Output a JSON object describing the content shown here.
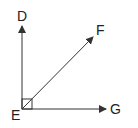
{
  "diagram": {
    "type": "geometry-angles",
    "vertex": {
      "label": "E",
      "x": 22,
      "y": 109
    },
    "rays": [
      {
        "label": "D",
        "tip": {
          "x": 22,
          "y": 26
        },
        "label_pos": {
          "x": 17,
          "y": 20
        }
      },
      {
        "label": "F",
        "tip": {
          "x": 93,
          "y": 37
        },
        "label_pos": {
          "x": 96,
          "y": 34
        }
      },
      {
        "label": "G",
        "tip": {
          "x": 106,
          "y": 109
        },
        "label_pos": {
          "x": 110,
          "y": 114
        }
      }
    ],
    "right_angle_marker": {
      "between": [
        "D",
        "G"
      ],
      "size": 10
    },
    "vertex_label_pos": {
      "x": 11,
      "y": 118
    },
    "stroke_color": "#333333"
  }
}
